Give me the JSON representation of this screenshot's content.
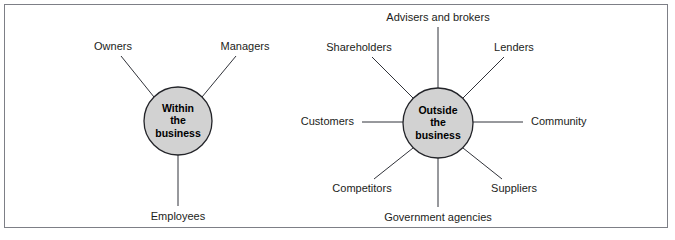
{
  "figure": {
    "background_color": "#ffffff",
    "frame_color": "#7d7f86",
    "hub_fill_color": "#d2d2d2",
    "hub_stroke_color": "#232429",
    "line_color": "#31333a",
    "text_color": "#1c1d21"
  },
  "diagrams": [
    {
      "id": "within-the-business",
      "hub": {
        "lines": [
          "Within",
          "the",
          "business"
        ],
        "cx": 178,
        "cy": 121,
        "r": 34
      },
      "nodes": [
        {
          "id": "owners",
          "label": "Owners",
          "text_x": 113,
          "text_y": 47,
          "anchor": "middle",
          "line_x1": 154,
          "line_y1": 97,
          "line_x2": 121,
          "line_y2": 56
        },
        {
          "id": "managers",
          "label": "Managers",
          "text_x": 245,
          "text_y": 47,
          "anchor": "middle",
          "line_x1": 202,
          "line_y1": 97,
          "line_x2": 236,
          "line_y2": 56
        },
        {
          "id": "employees",
          "label": "Employees",
          "text_x": 178,
          "text_y": 217,
          "anchor": "middle",
          "line_x1": 178,
          "line_y1": 155,
          "line_x2": 178,
          "line_y2": 206
        }
      ]
    },
    {
      "id": "outside-the-business",
      "hub": {
        "lines": [
          "Outside",
          "the",
          "business"
        ],
        "cx": 438,
        "cy": 123,
        "r": 35
      },
      "nodes": [
        {
          "id": "advisers-and-brokers",
          "label": "Advisers and brokers",
          "text_x": 438,
          "text_y": 18,
          "anchor": "middle",
          "line_x1": 438,
          "line_y1": 88,
          "line_x2": 438,
          "line_y2": 27
        },
        {
          "id": "shareholders",
          "label": "Shareholders",
          "text_x": 359,
          "text_y": 48,
          "anchor": "middle",
          "line_x1": 413,
          "line_y1": 98,
          "line_x2": 372,
          "line_y2": 57
        },
        {
          "id": "lenders",
          "label": "Lenders",
          "text_x": 514,
          "text_y": 48,
          "anchor": "middle",
          "line_x1": 463,
          "line_y1": 98,
          "line_x2": 504,
          "line_y2": 57
        },
        {
          "id": "customers",
          "label": "Customers",
          "text_x": 354,
          "text_y": 122,
          "anchor": "end",
          "line_x1": 403,
          "line_y1": 122,
          "line_x2": 362,
          "line_y2": 122
        },
        {
          "id": "community",
          "label": "Community",
          "text_x": 531,
          "text_y": 122,
          "anchor": "start",
          "line_x1": 473,
          "line_y1": 122,
          "line_x2": 523,
          "line_y2": 122
        },
        {
          "id": "competitors",
          "label": "Competitors",
          "text_x": 362,
          "text_y": 189,
          "anchor": "middle",
          "line_x1": 413,
          "line_y1": 148,
          "line_x2": 374,
          "line_y2": 179
        },
        {
          "id": "suppliers",
          "label": "Suppliers",
          "text_x": 514,
          "text_y": 189,
          "anchor": "middle",
          "line_x1": 463,
          "line_y1": 148,
          "line_x2": 502,
          "line_y2": 179
        },
        {
          "id": "government-agencies",
          "label": "Government agencies",
          "text_x": 438,
          "text_y": 218,
          "anchor": "middle",
          "line_x1": 438,
          "line_y1": 158,
          "line_x2": 438,
          "line_y2": 207
        }
      ]
    }
  ]
}
